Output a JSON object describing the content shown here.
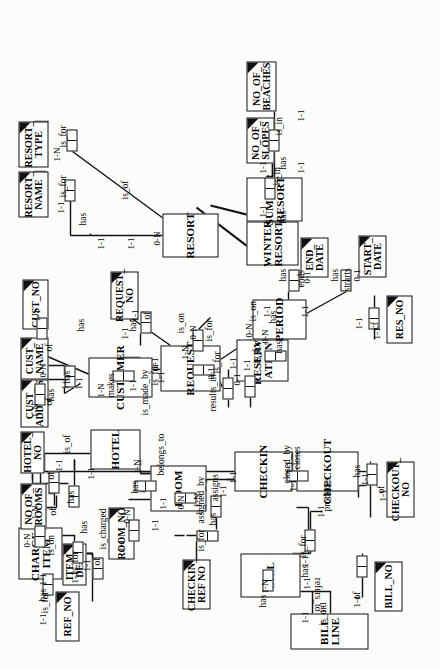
{
  "diagram": {
    "orientation": "rotated-90-ccw",
    "background": "#fcfcfa",
    "line_color": "#111111"
  },
  "entities": [
    {
      "id": "charge_item",
      "label": "CHARGE_\nITEM",
      "x": 90,
      "y": 18,
      "w": 52,
      "h": 44
    },
    {
      "id": "bill_line",
      "label": "BILL LINE",
      "x": 20,
      "y": 290,
      "w": 36,
      "h": 78
    },
    {
      "id": "bill",
      "label": "BILL",
      "x": 72,
      "y": 240,
      "w": 44,
      "h": 60
    },
    {
      "id": "room",
      "label": "ROOM",
      "x": 158,
      "y": 150,
      "w": 46,
      "h": 56
    },
    {
      "id": "hotel",
      "label": "HOTEL",
      "x": 200,
      "y": 90,
      "w": 40,
      "h": 50
    },
    {
      "id": "checkin",
      "label": "CHECKIN",
      "x": 178,
      "y": 234,
      "w": 40,
      "h": 58
    },
    {
      "id": "checkout",
      "label": "CHECKOUT",
      "x": 178,
      "y": 296,
      "w": 40,
      "h": 62
    },
    {
      "id": "customer",
      "label": "CUSTOMER",
      "x": 272,
      "y": 88,
      "w": 40,
      "h": 64
    },
    {
      "id": "request",
      "label": "REQUEST",
      "x": 278,
      "y": 160,
      "w": 46,
      "h": 60
    },
    {
      "id": "reservation",
      "label": "RESERV-\nATION",
      "x": 288,
      "y": 236,
      "w": 42,
      "h": 52
    },
    {
      "id": "period",
      "label": "PERIOD",
      "x": 330,
      "y": 252,
      "w": 40,
      "h": 54
    },
    {
      "id": "resort",
      "label": "RESORT",
      "x": 412,
      "y": 162,
      "w": 44,
      "h": 56
    },
    {
      "id": "winter",
      "label": "WINTER\nRESORT",
      "x": 404,
      "y": 246,
      "w": 44,
      "h": 52
    },
    {
      "id": "summer",
      "label": "SUMMER\nRESORT",
      "x": 448,
      "y": 246,
      "w": 44,
      "h": 56
    }
  ],
  "attributes": [
    {
      "id": "ref_no",
      "label": "REF_NO",
      "x": 28,
      "y": 55,
      "w": 50,
      "h": 24
    },
    {
      "id": "item_desc",
      "label": "ITEM_\nDESC",
      "x": 84,
      "y": 62,
      "w": 42,
      "h": 24
    },
    {
      "id": "no_of_rooms",
      "label": "NO OF_\nROOMS",
      "x": 140,
      "y": 20,
      "w": 46,
      "h": 26
    },
    {
      "id": "hotel_no",
      "label": "HOTEL_\nNO",
      "x": 196,
      "y": 20,
      "w": 42,
      "h": 24
    },
    {
      "id": "room_no",
      "label": "ROOM_NO",
      "x": 110,
      "y": 108,
      "w": 52,
      "h": 26
    },
    {
      "id": "checkin_ref_no",
      "label": "CHECKIN_\nREF NO",
      "x": 60,
      "y": 182,
      "w": 50,
      "h": 28
    },
    {
      "id": "bill_no",
      "label": "BILL_NO",
      "x": 58,
      "y": 374,
      "w": 50,
      "h": 28
    },
    {
      "id": "checkout_no",
      "label": "CHECKOUT_\nNO",
      "x": 152,
      "y": 386,
      "w": 56,
      "h": 28
    },
    {
      "id": "cust_address",
      "label": "CUST_\nADDRESS",
      "x": 242,
      "y": 20,
      "w": 48,
      "h": 28
    },
    {
      "id": "cust_name",
      "label": "CUST_\nNAME",
      "x": 290,
      "y": 20,
      "w": 42,
      "h": 28
    },
    {
      "id": "cust_no",
      "label": "CUST_NO",
      "x": 340,
      "y": 22,
      "w": 50,
      "h": 26
    },
    {
      "id": "request_no",
      "label": "REQUEST_\nNO",
      "x": 350,
      "y": 110,
      "w": 48,
      "h": 28
    },
    {
      "id": "res_no",
      "label": "RES_NO",
      "x": 326,
      "y": 386,
      "w": 48,
      "h": 26
    },
    {
      "id": "end_date",
      "label": "END_\nDATE",
      "x": 392,
      "y": 300,
      "w": 40,
      "h": 28
    },
    {
      "id": "start_date",
      "label": "START_\nDATE",
      "x": 392,
      "y": 358,
      "w": 42,
      "h": 28
    },
    {
      "id": "resort_type",
      "label": "RESORT_\nTYPE",
      "x": 502,
      "y": 18,
      "w": 46,
      "h": 30
    },
    {
      "id": "resort_name",
      "label": "RESORT_\nNAME",
      "x": 452,
      "y": 18,
      "w": 46,
      "h": 30
    },
    {
      "id": "no_of_slopes",
      "label": "NO_OF_\nSLOPES",
      "x": 506,
      "y": 246,
      "w": 46,
      "h": 28
    },
    {
      "id": "no_of_beaches",
      "label": "NO_OF_\nBEACHES",
      "x": 558,
      "y": 246,
      "w": 50,
      "h": 30
    }
  ],
  "verb_labels": [
    "is_for",
    "has",
    "of",
    "is_on",
    "refers_to",
    "is_charged",
    "is_for",
    "assigned_by",
    "belongs_to",
    "is_of",
    "has",
    "assigns",
    "has",
    "closed_by",
    "closes",
    "produces",
    "is_for",
    "has",
    "of",
    "makes",
    "is_made_by",
    "has",
    "results_in",
    "is_for",
    "is_for",
    "cf",
    "ends",
    "strarts",
    "is_on",
    "has",
    "is_in",
    "is_in",
    "is_for",
    "is_of"
  ],
  "cardinalities": [
    "1-1",
    "1-N",
    "0-N",
    "0-1"
  ],
  "labels": [
    {
      "id": "l1",
      "text": "is_for",
      "x": 56,
      "y": 40,
      "flip": false
    },
    {
      "id": "l2",
      "text": "has",
      "x": 68,
      "y": 38,
      "flip": false
    },
    {
      "id": "l3",
      "text": "of",
      "x": 104,
      "y": 92,
      "flip": false
    },
    {
      "id": "l4",
      "text": "has",
      "x": 136,
      "y": 79,
      "flip": false
    },
    {
      "id": "l5",
      "text": "is_on",
      "x": 114,
      "y": 46,
      "flip": false
    },
    {
      "id": "l6",
      "text": "refers_to",
      "x": 58,
      "y": 312,
      "flip": true
    },
    {
      "id": "l7",
      "text": "has",
      "x": 62,
      "y": 258,
      "flip": false
    },
    {
      "id": "l8",
      "text": "is_on",
      "x": 44,
      "y": 318,
      "flip": false
    },
    {
      "id": "l9",
      "text": "has",
      "x": 92,
      "y": 300,
      "flip": false
    },
    {
      "id": "l10",
      "text": "of",
      "x": 70,
      "y": 352,
      "flip": false
    },
    {
      "id": "l11",
      "text": "is_for",
      "x": 112,
      "y": 298,
      "flip": false
    },
    {
      "id": "l12",
      "text": "produces",
      "x": 158,
      "y": 322,
      "flip": false
    },
    {
      "id": "l13",
      "text": "is_charged",
      "x": 120,
      "y": 98,
      "flip": false
    },
    {
      "id": "l14",
      "text": "is_for",
      "x": 96,
      "y": 70,
      "flip": false
    },
    {
      "id": "l15",
      "text": "assigned_by",
      "x": 146,
      "y": 196,
      "flip": false
    },
    {
      "id": "l16",
      "text": "assigns",
      "x": 168,
      "y": 210,
      "flip": false
    },
    {
      "id": "l17",
      "text": "has",
      "x": 144,
      "y": 208,
      "flip": false
    },
    {
      "id": "l18",
      "text": "is_for",
      "x": 118,
      "y": 196,
      "flip": false
    },
    {
      "id": "l19",
      "text": "closed_by",
      "x": 186,
      "y": 282,
      "flip": false
    },
    {
      "id": "l20",
      "text": "closes",
      "x": 200,
      "y": 292,
      "flip": false
    },
    {
      "id": "l21",
      "text": "has",
      "x": 192,
      "y": 352,
      "flip": false
    },
    {
      "id": "l22",
      "text": "of",
      "x": 176,
      "y": 376,
      "flip": false
    },
    {
      "id": "l23",
      "text": "belongs_to",
      "x": 194,
      "y": 156,
      "flip": false
    },
    {
      "id": "l24",
      "text": "has",
      "x": 176,
      "y": 130,
      "flip": false
    },
    {
      "id": "l25",
      "text": "is_of",
      "x": 216,
      "y": 62,
      "flip": false
    },
    {
      "id": "l26",
      "text": "of",
      "x": 190,
      "y": 46,
      "flip": false
    },
    {
      "id": "l27",
      "text": "of",
      "x": 154,
      "y": 48,
      "flip": false
    },
    {
      "id": "l28",
      "text": "has",
      "x": 166,
      "y": 66,
      "flip": false
    },
    {
      "id": "l29",
      "text": "has",
      "x": 268,
      "y": 46,
      "flip": false
    },
    {
      "id": "l30",
      "text": "of",
      "x": 264,
      "y": 44,
      "flip": false
    },
    {
      "id": "l31",
      "text": "of",
      "x": 318,
      "y": 44,
      "flip": false
    },
    {
      "id": "l32",
      "text": "has",
      "x": 286,
      "y": 62,
      "flip": false
    },
    {
      "id": "l33",
      "text": "has",
      "x": 338,
      "y": 76,
      "flip": false
    },
    {
      "id": "l34",
      "text": "makes",
      "x": 272,
      "y": 106,
      "flip": false
    },
    {
      "id": "l35",
      "text": "is_made_by",
      "x": 254,
      "y": 140,
      "flip": false
    },
    {
      "id": "l36",
      "text": "is_for",
      "x": 284,
      "y": 150,
      "flip": false
    },
    {
      "id": "l37",
      "text": "has",
      "x": 338,
      "y": 128,
      "flip": false
    },
    {
      "id": "l38",
      "text": "of",
      "x": 350,
      "y": 142,
      "flip": false
    },
    {
      "id": "l39",
      "text": "is_on",
      "x": 336,
      "y": 176,
      "flip": false
    },
    {
      "id": "l40",
      "text": "results_in",
      "x": 258,
      "y": 208,
      "flip": false
    },
    {
      "id": "l41",
      "text": "is_for",
      "x": 296,
      "y": 212,
      "flip": false
    },
    {
      "id": "l42",
      "text": "is_for",
      "x": 306,
      "y": 252,
      "flip": false
    },
    {
      "id": "l43",
      "text": "has",
      "x": 316,
      "y": 274,
      "flip": false
    },
    {
      "id": "l44",
      "text": "has",
      "x": 346,
      "y": 268,
      "flip": false
    },
    {
      "id": "l45",
      "text": "cf",
      "x": 340,
      "y": 370,
      "flip": false
    },
    {
      "id": "l46",
      "text": "ends",
      "x": 382,
      "y": 296,
      "flip": false
    },
    {
      "id": "l47",
      "text": "strarts",
      "x": 378,
      "y": 342,
      "flip": false
    },
    {
      "id": "l48",
      "text": "is_on",
      "x": 348,
      "y": 248,
      "flip": false
    },
    {
      "id": "l49",
      "text": "has",
      "x": 388,
      "y": 278,
      "flip": false
    },
    {
      "id": "l50",
      "text": "has",
      "x": 388,
      "y": 330,
      "flip": false
    },
    {
      "id": "l51",
      "text": "is_for",
      "x": 328,
      "y": 204,
      "flip": false
    },
    {
      "id": "l52",
      "text": "has",
      "x": 444,
      "y": 78,
      "flip": false
    },
    {
      "id": "l53",
      "text": "is_for",
      "x": 472,
      "y": 58,
      "flip": false
    },
    {
      "id": "l54",
      "text": "is_for",
      "x": 522,
      "y": 58,
      "flip": false
    },
    {
      "id": "l55",
      "text": "is_of",
      "x": 470,
      "y": 120,
      "flip": false
    },
    {
      "id": "l56",
      "text": "has",
      "x": 446,
      "y": 278,
      "flip": false
    },
    {
      "id": "l57",
      "text": "is_in",
      "x": 484,
      "y": 272,
      "flip": false
    },
    {
      "id": "l58",
      "text": "has",
      "x": 500,
      "y": 278,
      "flip": false
    },
    {
      "id": "l59",
      "text": "is_in",
      "x": 534,
      "y": 274,
      "flip": false
    }
  ],
  "cardinality_marks": [
    {
      "id": "c1",
      "text": "1-1",
      "x": 44,
      "y": 38
    },
    {
      "id": "c2",
      "text": "1-1",
      "x": 84,
      "y": 38
    },
    {
      "id": "c3",
      "text": "1-1",
      "x": 86,
      "y": 70
    },
    {
      "id": "c4",
      "text": "1-1",
      "x": 98,
      "y": 82
    },
    {
      "id": "c5",
      "text": "0-N",
      "x": 122,
      "y": 22
    },
    {
      "id": "c6",
      "text": "1-1",
      "x": 46,
      "y": 300
    },
    {
      "id": "c7",
      "text": "1-N",
      "x": 76,
      "y": 260
    },
    {
      "id": "c8",
      "text": "1-1",
      "x": 56,
      "y": 318
    },
    {
      "id": "c9",
      "text": "1-1",
      "x": 80,
      "y": 302
    },
    {
      "id": "c10",
      "text": "1-1",
      "x": 62,
      "y": 352
    },
    {
      "id": "c11",
      "text": "1-1",
      "x": 102,
      "y": 300
    },
    {
      "id": "c12",
      "text": "1-1",
      "x": 152,
      "y": 316
    },
    {
      "id": "c13",
      "text": "1-1",
      "x": 154,
      "y": 194
    },
    {
      "id": "c14",
      "text": "0-N",
      "x": 146,
      "y": 122
    },
    {
      "id": "c15",
      "text": "1-1",
      "x": 138,
      "y": 150
    },
    {
      "id": "c16",
      "text": "1-N",
      "x": 162,
      "y": 192
    },
    {
      "id": "c17",
      "text": "1-1",
      "x": 172,
      "y": 218
    },
    {
      "id": "c18",
      "text": "1-1",
      "x": 186,
      "y": 228
    },
    {
      "id": "c19",
      "text": "1-1",
      "x": 178,
      "y": 288
    },
    {
      "id": "c20",
      "text": "1-1",
      "x": 196,
      "y": 284
    },
    {
      "id": "c21",
      "text": "1-1",
      "x": 184,
      "y": 360
    },
    {
      "id": "c22",
      "text": "1-1",
      "x": 168,
      "y": 378
    },
    {
      "id": "c23",
      "text": "1-1",
      "x": 160,
      "y": 158
    },
    {
      "id": "c24",
      "text": "0-N",
      "x": 160,
      "y": 176
    },
    {
      "id": "c25",
      "text": "1-N",
      "x": 196,
      "y": 132
    },
    {
      "id": "c26",
      "text": "1-1",
      "x": 190,
      "y": 86
    },
    {
      "id": "c27",
      "text": "1-1",
      "x": 198,
      "y": 54
    },
    {
      "id": "c28",
      "text": "1-N",
      "x": 150,
      "y": 30
    },
    {
      "id": "c29",
      "text": "1-1",
      "x": 118,
      "y": 116
    },
    {
      "id": "c30",
      "text": "1-N",
      "x": 252,
      "y": 30
    },
    {
      "id": "c31",
      "text": "0-N",
      "x": 292,
      "y": 38
    },
    {
      "id": "c32",
      "text": "1-1",
      "x": 348,
      "y": 32
    },
    {
      "id": "c33",
      "text": "1-1",
      "x": 280,
      "y": 60
    },
    {
      "id": "c34",
      "text": "1-1",
      "x": 280,
      "y": 74
    },
    {
      "id": "c35",
      "text": "1-N",
      "x": 272,
      "y": 96
    },
    {
      "id": "c36",
      "text": "1-1",
      "x": 278,
      "y": 128
    },
    {
      "id": "c37",
      "text": "1-1",
      "x": 300,
      "y": 150
    },
    {
      "id": "c38",
      "text": "1-1",
      "x": 286,
      "y": 156
    },
    {
      "id": "c39",
      "text": "1-1",
      "x": 330,
      "y": 120
    },
    {
      "id": "c40",
      "text": "1-1",
      "x": 348,
      "y": 130
    },
    {
      "id": "c41",
      "text": "1-N",
      "x": 310,
      "y": 180
    },
    {
      "id": "c42",
      "text": "0-N",
      "x": 330,
      "y": 188
    },
    {
      "id": "c43",
      "text": "0-1",
      "x": 290,
      "y": 206
    },
    {
      "id": "c44",
      "text": "0-1",
      "x": 284,
      "y": 232
    },
    {
      "id": "c45",
      "text": "1-1",
      "x": 298,
      "y": 242
    },
    {
      "id": "c46",
      "text": "1-1",
      "x": 300,
      "y": 228
    },
    {
      "id": "c47",
      "text": "0-N",
      "x": 326,
      "y": 260
    },
    {
      "id": "c48",
      "text": "1-1",
      "x": 330,
      "y": 372
    },
    {
      "id": "c49",
      "text": "1-1",
      "x": 340,
      "y": 354
    },
    {
      "id": "c50",
      "text": "1-1",
      "x": 352,
      "y": 262
    },
    {
      "id": "c51",
      "text": "1-1",
      "x": 352,
      "y": 300
    },
    {
      "id": "c52",
      "text": "0-1",
      "x": 386,
      "y": 302
    },
    {
      "id": "c53",
      "text": "0-1",
      "x": 388,
      "y": 352
    },
    {
      "id": "c54",
      "text": "0-N",
      "x": 332,
      "y": 244
    },
    {
      "id": "c55",
      "text": "1-1",
      "x": 456,
      "y": 56
    },
    {
      "id": "c56",
      "text": "1-N",
      "x": 508,
      "y": 52
    },
    {
      "id": "c57",
      "text": "1-1",
      "x": 420,
      "y": 96
    },
    {
      "id": "c58",
      "text": "1-1",
      "x": 420,
      "y": 126
    },
    {
      "id": "c59",
      "text": "0-N",
      "x": 424,
      "y": 152
    },
    {
      "id": "c60",
      "text": "1-1",
      "x": 452,
      "y": 258
    },
    {
      "id": "c61",
      "text": "1-1",
      "x": 496,
      "y": 258
    },
    {
      "id": "c62",
      "text": "1-1",
      "x": 496,
      "y": 296
    },
    {
      "id": "c63",
      "text": "1-1",
      "x": 548,
      "y": 296
    }
  ],
  "relationship_boxes": [
    {
      "id": "r1",
      "orient": "h",
      "x": 74,
      "y": 42
    },
    {
      "id": "r2",
      "orient": "h",
      "x": 122,
      "y": 34
    },
    {
      "id": "r3",
      "orient": "h",
      "x": 90,
      "y": 92
    },
    {
      "id": "r4",
      "orient": "h",
      "x": 106,
      "y": 72
    },
    {
      "id": "r5",
      "orient": "h",
      "x": 78,
      "y": 262
    },
    {
      "id": "r6",
      "orient": "h",
      "x": 92,
      "y": 356
    },
    {
      "id": "r7",
      "orient": "h",
      "x": 118,
      "y": 304
    },
    {
      "id": "r8",
      "orient": "h",
      "x": 184,
      "y": 366
    },
    {
      "id": "r9",
      "orient": "v",
      "x": 188,
      "y": 286
    },
    {
      "id": "r10",
      "orient": "v",
      "x": 128,
      "y": 196
    },
    {
      "id": "r11",
      "orient": "h",
      "x": 152,
      "y": 210
    },
    {
      "id": "r12",
      "orient": "h",
      "x": 128,
      "y": 128
    },
    {
      "id": "r13",
      "orient": "v",
      "x": 178,
      "y": 134
    },
    {
      "id": "r14",
      "orient": "h",
      "x": 176,
      "y": 48
    },
    {
      "id": "r15",
      "orient": "h",
      "x": 162,
      "y": 68
    },
    {
      "id": "r16",
      "orient": "v",
      "x": 166,
      "y": 174
    },
    {
      "id": "r17",
      "orient": "h",
      "x": 264,
      "y": 34
    },
    {
      "id": "r18",
      "orient": "h",
      "x": 282,
      "y": 64
    },
    {
      "id": "r19",
      "orient": "h",
      "x": 330,
      "y": 36
    },
    {
      "id": "r20",
      "orient": "v",
      "x": 288,
      "y": 112
    },
    {
      "id": "r21",
      "orient": "h",
      "x": 336,
      "y": 140
    },
    {
      "id": "r22",
      "orient": "v",
      "x": 294,
      "y": 192
    },
    {
      "id": "r23",
      "orient": "h",
      "x": 270,
      "y": 222
    },
    {
      "id": "r24",
      "orient": "h",
      "x": 272,
      "y": 244
    },
    {
      "id": "r25",
      "orient": "h",
      "x": 318,
      "y": 192
    },
    {
      "id": "r26",
      "orient": "v",
      "x": 308,
      "y": 264
    },
    {
      "id": "r27",
      "orient": "h",
      "x": 340,
      "y": 368
    },
    {
      "id": "r28",
      "orient": "h",
      "x": 378,
      "y": 288
    },
    {
      "id": "r29",
      "orient": "h",
      "x": 378,
      "y": 340
    },
    {
      "id": "r30",
      "orient": "h",
      "x": 468,
      "y": 64
    },
    {
      "id": "r31",
      "orient": "h",
      "x": 518,
      "y": 66
    },
    {
      "id": "r32",
      "orient": "h",
      "x": 470,
      "y": 264
    },
    {
      "id": "r33",
      "orient": "h",
      "x": 518,
      "y": 268
    }
  ],
  "subtype_arrows": [
    {
      "id": "a1",
      "from": "winter",
      "to": "resort"
    },
    {
      "id": "a2",
      "from": "summer",
      "to": "resort"
    }
  ]
}
